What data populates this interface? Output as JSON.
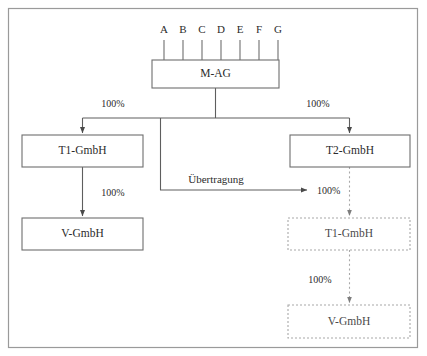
{
  "diagram": {
    "type": "corporate-structure-transfer",
    "frame": {
      "x": 8,
      "y": 8,
      "width": 410,
      "height": 340
    },
    "shareholders": [
      {
        "id": "A",
        "label": "A",
        "x": 164
      },
      {
        "id": "B",
        "label": "B",
        "x": 183
      },
      {
        "id": "C",
        "label": "C",
        "x": 202
      },
      {
        "id": "D",
        "label": "D",
        "x": 221
      },
      {
        "id": "E",
        "label": "E",
        "x": 240
      },
      {
        "id": "F",
        "label": "F",
        "x": 259
      },
      {
        "id": "G",
        "label": "G",
        "x": 278
      }
    ],
    "shareholder_line": {
      "y_top": 38,
      "y_bottom": 60
    },
    "boxes": [
      {
        "id": "m-ag",
        "label": "M-AG",
        "x": 152,
        "y": 60,
        "width": 127,
        "height": 28,
        "style": "solid"
      },
      {
        "id": "t1-gmbh-left",
        "label": "T1-GmbH",
        "x": 22,
        "y": 135,
        "width": 121,
        "height": 32,
        "style": "solid"
      },
      {
        "id": "t2-gmbh",
        "label": "T2-GmbH",
        "x": 290,
        "y": 135,
        "width": 120,
        "height": 32,
        "style": "solid"
      },
      {
        "id": "v-gmbh-left",
        "label": "V-GmbH",
        "x": 22,
        "y": 218,
        "width": 121,
        "height": 32,
        "style": "solid"
      },
      {
        "id": "t1-gmbh-right",
        "label": "T1-GmbH",
        "x": 288,
        "y": 218,
        "width": 122,
        "height": 32,
        "style": "dotted"
      },
      {
        "id": "v-gmbh-right",
        "label": "V-GmbH",
        "x": 288,
        "y": 305,
        "width": 122,
        "height": 33,
        "style": "dotted"
      }
    ],
    "percent_labels": [
      {
        "id": "pct-m-to-t1",
        "text": "100%",
        "x": 113,
        "y": 107
      },
      {
        "id": "pct-m-to-t2",
        "text": "100%",
        "x": 318,
        "y": 107
      },
      {
        "id": "pct-t1-to-v-left",
        "text": "100%",
        "x": 113,
        "y": 196
      },
      {
        "id": "pct-transfer-target",
        "text": "100%",
        "x": 336,
        "y": 194
      },
      {
        "id": "pct-t1-to-v-right",
        "text": "100%",
        "x": 320,
        "y": 283
      }
    ],
    "transfer_label": {
      "id": "uebertragung",
      "text": "Übertragung",
      "x": 216,
      "y": 183
    },
    "colors": {
      "frame_stroke": "#9a9a9a",
      "solid_stroke": "#6e6e6e",
      "dotted_stroke": "#a8a8a8",
      "connector": "#5e5e5e",
      "text": "#2b2b2b",
      "background": "#ffffff"
    }
  }
}
